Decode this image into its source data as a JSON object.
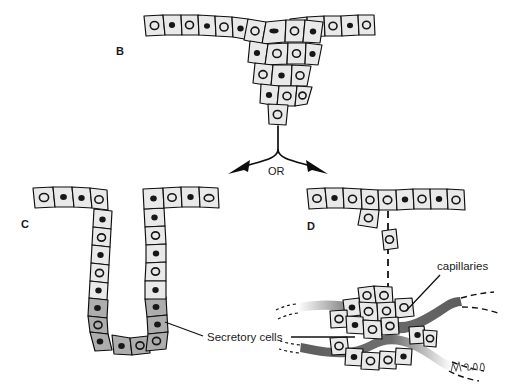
{
  "figure": {
    "background_color": "#ffffff",
    "line_color": "#0d0d0d",
    "cell_fill": "#e9e9e9",
    "secretory_cell_fill": "#adadad",
    "capillary_fill": "#6f6f6f"
  },
  "panels": [
    {
      "id": "B",
      "letter": "B",
      "description": "Epithelial sheet with downgrowth of proliferating cells forming a solid cord"
    },
    {
      "id": "C",
      "letter": "C",
      "description": "Exocrine gland: duct remains connected to surface epithelium, secretory cells at base"
    },
    {
      "id": "D",
      "letter": "D",
      "description": "Endocrine gland: connection with surface epithelium lost, cell cluster surrounded by capillaries"
    }
  ],
  "branch": {
    "or_label": "OR"
  },
  "callouts": [
    {
      "id": "secretory-cells",
      "label": "Secretory cells"
    },
    {
      "id": "capillaries",
      "label": "capillaries"
    }
  ],
  "credit": {
    "signature": "artist-signature"
  }
}
